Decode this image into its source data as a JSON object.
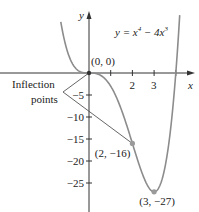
{
  "chart_data": {
    "type": "line",
    "equation": {
      "prefix": "y = x",
      "exp1": "4",
      "mid": " − 4x",
      "exp2": "3"
    },
    "xlabel": "x",
    "ylabel": "y",
    "function": {
      "coeffs": {
        "x4": 1,
        "x3": -4
      },
      "x_range": [
        -1.3,
        4.18
      ]
    },
    "xlim": [
      -4,
      4.8
    ],
    "ylim": [
      -31,
      14
    ],
    "x_ticks": [
      1,
      2,
      3,
      4
    ],
    "x_tick_labels": [
      {
        "value": 2,
        "label": "2"
      },
      {
        "value": 3,
        "label": "3"
      }
    ],
    "y_ticks": [
      -5,
      -10,
      -15,
      -20,
      -25
    ],
    "y_tick_labels": [
      "−5",
      "−10",
      "−15",
      "−20",
      "−25"
    ],
    "grid": false,
    "points": [
      {
        "x": 0,
        "y": 0,
        "label": "(0, 0)"
      },
      {
        "x": 2,
        "y": -16,
        "label": "(2, −16)"
      },
      {
        "x": 3,
        "y": -27,
        "label": "(3, −27)"
      }
    ],
    "annotation": {
      "line1": "Inflection",
      "line2": "points",
      "targets": [
        [
          0,
          0
        ],
        [
          2,
          -16
        ]
      ]
    },
    "colors": {
      "curve": "#8c8c8c",
      "axis": "#333333",
      "point": "#9a9a9a"
    }
  }
}
